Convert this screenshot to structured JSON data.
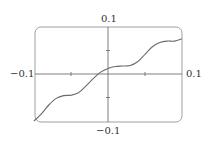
{
  "chart_data": {
    "type": "line",
    "title": "",
    "xlabel": "",
    "ylabel": "",
    "xlim": [
      -0.1,
      0.1
    ],
    "ylim": [
      -0.1,
      0.1
    ],
    "grid": false,
    "legend": null,
    "tick_labels": {
      "x_left": "−0.1",
      "x_right": "0.1",
      "y_top": "0.1",
      "y_bottom": "−0.1"
    },
    "x_ticks": [
      -0.05,
      0.05
    ],
    "y_ticks": [
      -0.05,
      0.05
    ],
    "series": [
      {
        "name": "f(x)",
        "x": [
          -0.1,
          -0.09,
          -0.08,
          -0.07,
          -0.06,
          -0.05,
          -0.04,
          -0.03,
          -0.02,
          -0.01,
          0.0,
          0.01,
          0.02,
          0.03,
          0.04,
          0.05,
          0.06,
          0.07,
          0.08,
          0.09,
          0.1
        ],
        "y": [
          -0.1,
          -0.085,
          -0.066,
          -0.052,
          -0.046,
          -0.045,
          -0.04,
          -0.026,
          -0.01,
          0.004,
          0.012,
          0.016,
          0.017,
          0.018,
          0.026,
          0.042,
          0.058,
          0.067,
          0.07,
          0.07,
          0.075
        ]
      }
    ],
    "colors": {
      "curve": "#6b6b6b",
      "frame": "#9a9a9a",
      "axes": "#6a6a6a"
    }
  }
}
